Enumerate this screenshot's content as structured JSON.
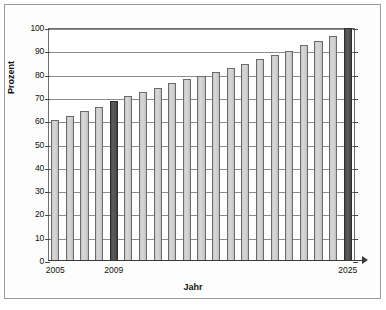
{
  "chart_data": {
    "type": "bar",
    "title": "",
    "xlabel": "Jahr",
    "ylabel": "Prozent",
    "ylim": [
      0,
      100
    ],
    "ytick_labels": [
      "0",
      "10",
      "20",
      "30",
      "40",
      "50",
      "60",
      "70",
      "80",
      "90",
      "100"
    ],
    "ytick_values": [
      0,
      10,
      20,
      30,
      40,
      50,
      60,
      70,
      80,
      90,
      100
    ],
    "xtick_labels": [
      "2005",
      "2009",
      "2025"
    ],
    "xtick_values": [
      2005,
      2009,
      2025
    ],
    "grid": "horizontal",
    "legend": "none",
    "categories": [
      "2005",
      "2006",
      "2007",
      "2008",
      "2009",
      "2010",
      "2011",
      "2012",
      "2013",
      "2014",
      "2015",
      "2016",
      "2017",
      "2018",
      "2019",
      "2020",
      "2021",
      "2022",
      "2023",
      "2024",
      "2025"
    ],
    "values": [
      60.5,
      62.3,
      64.2,
      66.3,
      68.5,
      70.8,
      72.5,
      74.2,
      76.4,
      78.2,
      79.5,
      81.3,
      83.0,
      84.6,
      86.5,
      88.3,
      90.0,
      92.5,
      94.5,
      96.5,
      100.0
    ],
    "highlighted_categories": [
      "2009",
      "2025"
    ],
    "colors": {
      "bar_fill": "#cfcfcf",
      "bar_border": "#6b6b6b",
      "bar_highlight_fill": "#4f4f4f",
      "bar_highlight_border": "#2e2e2e",
      "gridline": "#8c8c8c",
      "axis": "#3a3a3a",
      "text": "#111111",
      "frame": "#6e6e6e",
      "outer_frame": "#9a9a9a",
      "background": "#ffffff"
    }
  }
}
